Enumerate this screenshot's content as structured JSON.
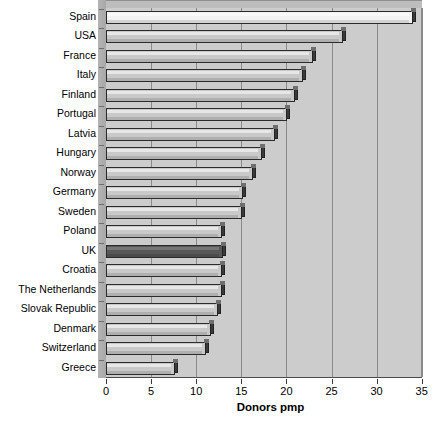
{
  "chart_data": {
    "type": "bar",
    "orientation": "horizontal",
    "title": "",
    "xlabel": "Donors pmp",
    "ylabel": "",
    "xlim": [
      0,
      35
    ],
    "xticks": [
      0,
      5,
      10,
      15,
      20,
      25,
      30,
      35
    ],
    "grid": "vertical",
    "legend": "none",
    "categories": [
      "Spain",
      "USA",
      "France",
      "Italy",
      "Finland",
      "Portugal",
      "Latvia",
      "Hungary",
      "Norway",
      "Germany",
      "Sweden",
      "Poland",
      "UK",
      "Croatia",
      "The Netherlands",
      "Slovak Republic",
      "Denmark",
      "Switzerland",
      "Greece"
    ],
    "values": [
      34.0,
      26.3,
      23.0,
      21.8,
      20.9,
      20.1,
      18.7,
      17.3,
      16.3,
      15.2,
      15.1,
      12.9,
      13.0,
      12.9,
      12.9,
      12.4,
      11.6,
      11.1,
      7.7
    ],
    "highlight_category": "UK",
    "colors": {
      "bar_fill": "#c9c9c9",
      "bar_fill_highlight": "#585858",
      "bar_fill_first": "#f2f2f2",
      "bar_edge": "#2b2b2b",
      "plot_background": "#cccccc",
      "gridline": "#8a8a8a",
      "text": "#000000"
    }
  }
}
